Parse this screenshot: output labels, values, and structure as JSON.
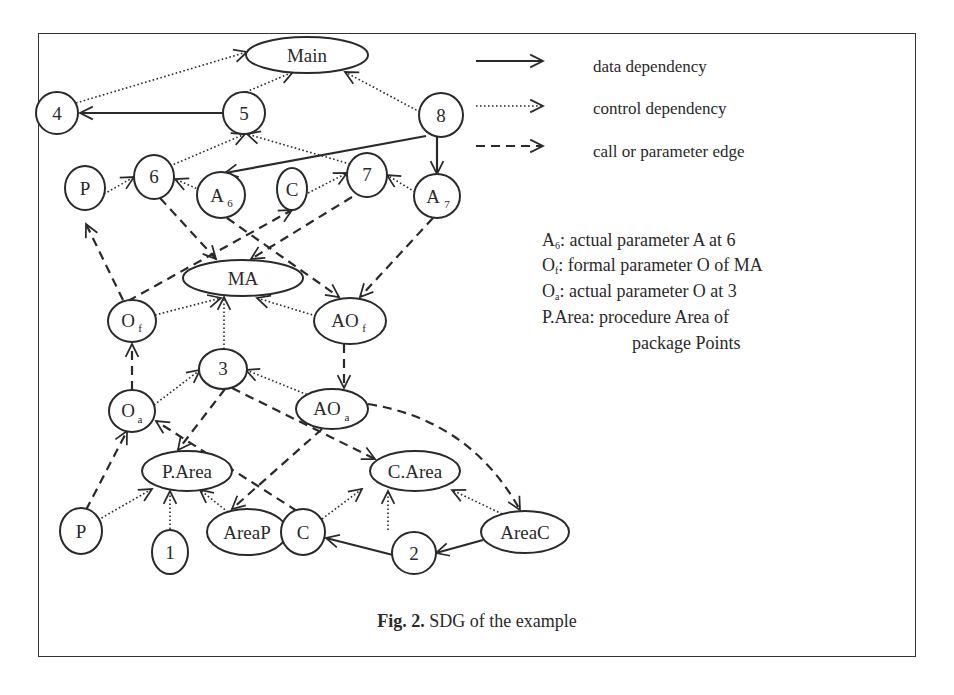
{
  "figure": {
    "caption_label": "Fig. 2.",
    "caption_text": " SDG of the example"
  },
  "legend": {
    "items": [
      {
        "style": "solid",
        "label": "data dependency"
      },
      {
        "style": "dotted",
        "label": "control dependency"
      },
      {
        "style": "dashed",
        "label": "call or parameter edge"
      }
    ]
  },
  "notes": [
    {
      "sym": "A",
      "sub": "6",
      "text": ": actual parameter A at 6"
    },
    {
      "sym": "O",
      "sub": "f",
      "text": ": formal parameter O of MA"
    },
    {
      "sym": "O",
      "sub": "a",
      "text": ": actual parameter O at 3"
    },
    {
      "sym": "P.Area",
      "sub": "",
      "text": ": procedure Area of"
    },
    {
      "sym": "",
      "sub": "",
      "text": "package Points"
    }
  ],
  "nodes": {
    "main": {
      "label": "Main"
    },
    "n4": {
      "label": "4"
    },
    "n5": {
      "label": "5"
    },
    "n8": {
      "label": "8"
    },
    "p_top": {
      "label": "P"
    },
    "n6": {
      "label": "6"
    },
    "a6": {
      "label": "A",
      "sub": "6"
    },
    "c_top": {
      "label": "C"
    },
    "n7": {
      "label": "7"
    },
    "a7": {
      "label": "A",
      "sub": "7"
    },
    "ma": {
      "label": "MA"
    },
    "of": {
      "label": "O",
      "sub": "f"
    },
    "aof": {
      "label": "AO",
      "sub": "f"
    },
    "n3": {
      "label": "3"
    },
    "oa": {
      "label": "O",
      "sub": "a"
    },
    "aoa": {
      "label": "AO",
      "sub": "a"
    },
    "parea": {
      "label": "P.Area"
    },
    "carea": {
      "label": "C.Area"
    },
    "p_bot": {
      "label": "P"
    },
    "n1": {
      "label": "1"
    },
    "areap": {
      "label": "AreaP"
    },
    "c_bot": {
      "label": "C"
    },
    "n2": {
      "label": "2"
    },
    "areac": {
      "label": "AreaC"
    }
  },
  "edges": [
    {
      "from": "5",
      "to": "4",
      "type": "data"
    },
    {
      "from": "8",
      "to": "A6",
      "type": "data"
    },
    {
      "from": "8",
      "to": "A7",
      "type": "data"
    },
    {
      "from": "2",
      "to": "C",
      "type": "data"
    },
    {
      "from": "AreaC",
      "to": "2",
      "type": "data"
    },
    {
      "from": "4",
      "to": "Main",
      "type": "control"
    },
    {
      "from": "5",
      "to": "Main",
      "type": "control"
    },
    {
      "from": "8",
      "to": "Main",
      "type": "control"
    },
    {
      "from": "6",
      "to": "5",
      "type": "control"
    },
    {
      "from": "7",
      "to": "5",
      "type": "control"
    },
    {
      "from": "P",
      "to": "6",
      "type": "control"
    },
    {
      "from": "A6",
      "to": "6",
      "type": "control"
    },
    {
      "from": "C",
      "to": "7",
      "type": "control"
    },
    {
      "from": "A7",
      "to": "7",
      "type": "control"
    },
    {
      "from": "Of",
      "to": "MA",
      "type": "control"
    },
    {
      "from": "3",
      "to": "MA",
      "type": "control"
    },
    {
      "from": "AOf",
      "to": "MA",
      "type": "control"
    },
    {
      "from": "Oa",
      "to": "3",
      "type": "control"
    },
    {
      "from": "AOa",
      "to": "3",
      "type": "control"
    },
    {
      "from": "P",
      "to": "P.Area",
      "type": "control"
    },
    {
      "from": "1",
      "to": "P.Area",
      "type": "control"
    },
    {
      "from": "AreaP",
      "to": "P.Area",
      "type": "control"
    },
    {
      "from": "C",
      "to": "C.Area",
      "type": "control"
    },
    {
      "from": "2",
      "to": "C.Area",
      "type": "control"
    },
    {
      "from": "AreaC",
      "to": "C.Area",
      "type": "control"
    },
    {
      "from": "6",
      "to": "MA",
      "type": "call"
    },
    {
      "from": "7",
      "to": "MA",
      "type": "call"
    },
    {
      "from": "A6",
      "to": "AOf",
      "type": "call"
    },
    {
      "from": "A7",
      "to": "AOf",
      "type": "call"
    },
    {
      "from": "Of",
      "to": "P",
      "type": "call"
    },
    {
      "from": "Of",
      "to": "C",
      "type": "call"
    },
    {
      "from": "Oa",
      "to": "Of",
      "type": "call"
    },
    {
      "from": "AOf",
      "to": "AOa",
      "type": "call"
    },
    {
      "from": "3",
      "to": "P.Area",
      "type": "call"
    },
    {
      "from": "3",
      "to": "C.Area",
      "type": "call"
    },
    {
      "from": "AOa",
      "to": "AreaP",
      "type": "call"
    },
    {
      "from": "AOa",
      "to": "AreaC",
      "type": "call"
    },
    {
      "from": "P",
      "to": "Oa",
      "type": "call"
    },
    {
      "from": "C",
      "to": "Oa",
      "type": "call"
    }
  ]
}
